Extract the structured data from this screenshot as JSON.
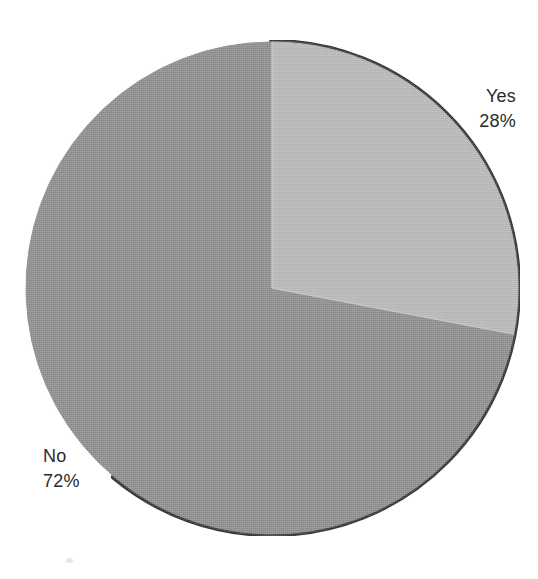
{
  "chart_data": {
    "type": "pie",
    "title": "",
    "subtitle": "",
    "xlabel": "",
    "ylabel": "",
    "legend_position": "none",
    "grid": false,
    "labels_inline": true,
    "categories": [
      "Yes",
      "No"
    ],
    "values": [
      28,
      72
    ],
    "units": "%",
    "start_angle_deg": 0,
    "direction": "clockwise",
    "slices": [
      {
        "label": "Yes",
        "value": 28,
        "value_text": "28%",
        "color": "#b5b5b5",
        "sweep_deg": 100.8,
        "label_position": "right-top"
      },
      {
        "label": "No",
        "value": 72,
        "value_text": "72%",
        "color": "#8a8a8a",
        "sweep_deg": 259.2,
        "label_position": "left-bottom"
      }
    ]
  },
  "figure": {
    "background_color": "#ffffff",
    "text_color": "#2b2b2b",
    "shadow_color": "#2a2a2a",
    "center_x": 248,
    "center_y": 248,
    "radius": 246
  },
  "labels": {
    "yes": {
      "name": "Yes",
      "value": "28%"
    },
    "no": {
      "name": "No",
      "value": "72%"
    }
  }
}
